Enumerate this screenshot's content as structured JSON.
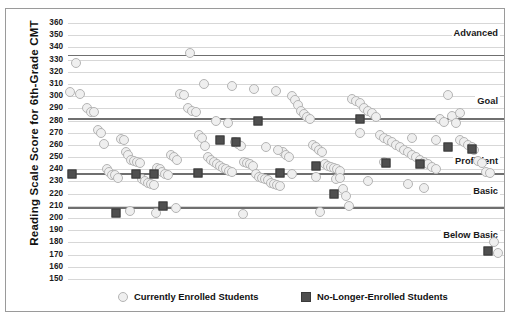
{
  "chart_data": {
    "type": "scatter",
    "title": "",
    "ylabel": "Reading Scale Score for 6th-Grade CMT",
    "xlabel": "",
    "ylim": [
      150,
      360
    ],
    "ytick_step": 10,
    "yticks": [
      360,
      350,
      340,
      330,
      320,
      310,
      300,
      290,
      280,
      270,
      260,
      250,
      240,
      230,
      220,
      210,
      200,
      190,
      180,
      170,
      160,
      150
    ],
    "grid": true,
    "xaxis_visible": false,
    "legend_position": "bottom",
    "band_lines": [
      {
        "label": "Advanced",
        "value": 334,
        "label_y": 352
      },
      {
        "label": "Goal",
        "value": 282,
        "label_y": 296
      },
      {
        "label": "Proficient",
        "value": 237,
        "label_y": 247
      },
      {
        "label": "Basic",
        "value": 209,
        "label_y": 222
      }
    ],
    "below_basic_label": {
      "label": "Below Basic",
      "label_y": 186
    },
    "series": [
      {
        "name": "Currently Enrolled Students",
        "marker": "circle",
        "color": "#efefef",
        "edge_color": "#b4b4b4",
        "points": [
          [
            2,
            303
          ],
          [
            8,
            327
          ],
          [
            12,
            302
          ],
          [
            19,
            290
          ],
          [
            23,
            287
          ],
          [
            26,
            287
          ],
          [
            30,
            272
          ],
          [
            33,
            270
          ],
          [
            36,
            261
          ],
          [
            39,
            240
          ],
          [
            41,
            238
          ],
          [
            44,
            235
          ],
          [
            47,
            235
          ],
          [
            50,
            233
          ],
          [
            53,
            265
          ],
          [
            56,
            264
          ],
          [
            58,
            254
          ],
          [
            60,
            252
          ],
          [
            63,
            248
          ],
          [
            66,
            247
          ],
          [
            69,
            246
          ],
          [
            72,
            245
          ],
          [
            74,
            232
          ],
          [
            77,
            230
          ],
          [
            80,
            229
          ],
          [
            83,
            228
          ],
          [
            86,
            227
          ],
          [
            89,
            241
          ],
          [
            92,
            240
          ],
          [
            94,
            238
          ],
          [
            97,
            236
          ],
          [
            100,
            235
          ],
          [
            103,
            252
          ],
          [
            106,
            250
          ],
          [
            109,
            248
          ],
          [
            112,
            302
          ],
          [
            116,
            301
          ],
          [
            120,
            290
          ],
          [
            124,
            288
          ],
          [
            128,
            287
          ],
          [
            131,
            268
          ],
          [
            134,
            266
          ],
          [
            137,
            259
          ],
          [
            140,
            250
          ],
          [
            143,
            248
          ],
          [
            146,
            246
          ],
          [
            149,
            244
          ],
          [
            152,
            243
          ],
          [
            155,
            241
          ],
          [
            158,
            240
          ],
          [
            161,
            239
          ],
          [
            164,
            238
          ],
          [
            167,
            262
          ],
          [
            170,
            261
          ],
          [
            173,
            259
          ],
          [
            176,
            246
          ],
          [
            179,
            245
          ],
          [
            182,
            244
          ],
          [
            185,
            243
          ],
          [
            188,
            236
          ],
          [
            191,
            234
          ],
          [
            194,
            233
          ],
          [
            197,
            232
          ],
          [
            200,
            231
          ],
          [
            203,
            229
          ],
          [
            206,
            228
          ],
          [
            209,
            227
          ],
          [
            212,
            226
          ],
          [
            215,
            254
          ],
          [
            218,
            252
          ],
          [
            221,
            250
          ],
          [
            224,
            300
          ],
          [
            227,
            297
          ],
          [
            230,
            293
          ],
          [
            233,
            288
          ],
          [
            236,
            285
          ],
          [
            239,
            283
          ],
          [
            242,
            281
          ],
          [
            245,
            260
          ],
          [
            248,
            258
          ],
          [
            251,
            256
          ],
          [
            254,
            254
          ],
          [
            257,
            244
          ],
          [
            260,
            243
          ],
          [
            263,
            242
          ],
          [
            266,
            241
          ],
          [
            269,
            240
          ],
          [
            272,
            239
          ],
          [
            275,
            224
          ],
          [
            278,
            218
          ],
          [
            281,
            210
          ],
          [
            284,
            298
          ],
          [
            288,
            296
          ],
          [
            292,
            294
          ],
          [
            296,
            290
          ],
          [
            300,
            288
          ],
          [
            304,
            286
          ],
          [
            308,
            283
          ],
          [
            312,
            268
          ],
          [
            316,
            266
          ],
          [
            320,
            264
          ],
          [
            324,
            262
          ],
          [
            328,
            260
          ],
          [
            332,
            258
          ],
          [
            336,
            256
          ],
          [
            340,
            254
          ],
          [
            344,
            252
          ],
          [
            348,
            250
          ],
          [
            352,
            248
          ],
          [
            356,
            246
          ],
          [
            360,
            244
          ],
          [
            364,
            242
          ],
          [
            368,
            240
          ],
          [
            372,
            281
          ],
          [
            376,
            279
          ],
          [
            380,
            301
          ],
          [
            384,
            284
          ],
          [
            388,
            278
          ],
          [
            392,
            264
          ],
          [
            396,
            262
          ],
          [
            400,
            260
          ],
          [
            404,
            258
          ],
          [
            406,
            256
          ],
          [
            410,
            247
          ],
          [
            414,
            245
          ],
          [
            418,
            238
          ],
          [
            422,
            237
          ],
          [
            426,
            180
          ],
          [
            430,
            171
          ],
          [
            175,
            203
          ],
          [
            252,
            205
          ],
          [
            108,
            208
          ],
          [
            62,
            206
          ],
          [
            88,
            204
          ],
          [
            340,
            228
          ],
          [
            356,
            225
          ],
          [
            300,
            230
          ],
          [
            268,
            232
          ],
          [
            198,
            258
          ],
          [
            210,
            256
          ],
          [
            148,
            280
          ],
          [
            160,
            278
          ],
          [
            122,
            335
          ],
          [
            136,
            310
          ],
          [
            164,
            308
          ],
          [
            186,
            306
          ],
          [
            208,
            304
          ],
          [
            292,
            270
          ],
          [
            316,
            246
          ],
          [
            224,
            236
          ],
          [
            248,
            234
          ],
          [
            272,
            233
          ],
          [
            344,
            266
          ],
          [
            368,
            264
          ],
          [
            392,
            286
          ]
        ]
      },
      {
        "name": "No-Longer-Enrolled Students",
        "marker": "square",
        "color": "#4f4f4f",
        "edge_color": "#3a3a3a",
        "points": [
          [
            4,
            236
          ],
          [
            48,
            204
          ],
          [
            68,
            236
          ],
          [
            86,
            236
          ],
          [
            95,
            210
          ],
          [
            130,
            237
          ],
          [
            152,
            264
          ],
          [
            168,
            262
          ],
          [
            190,
            280
          ],
          [
            212,
            237
          ],
          [
            248,
            243
          ],
          [
            266,
            220
          ],
          [
            292,
            281
          ],
          [
            318,
            245
          ],
          [
            352,
            244
          ],
          [
            380,
            258
          ],
          [
            404,
            257
          ],
          [
            420,
            173
          ]
        ]
      }
    ]
  },
  "legend": {
    "items": [
      {
        "label": "Currently Enrolled Students",
        "marker": "circle-icon"
      },
      {
        "label": "No-Longer-Enrolled Students",
        "marker": "square-icon"
      }
    ]
  }
}
